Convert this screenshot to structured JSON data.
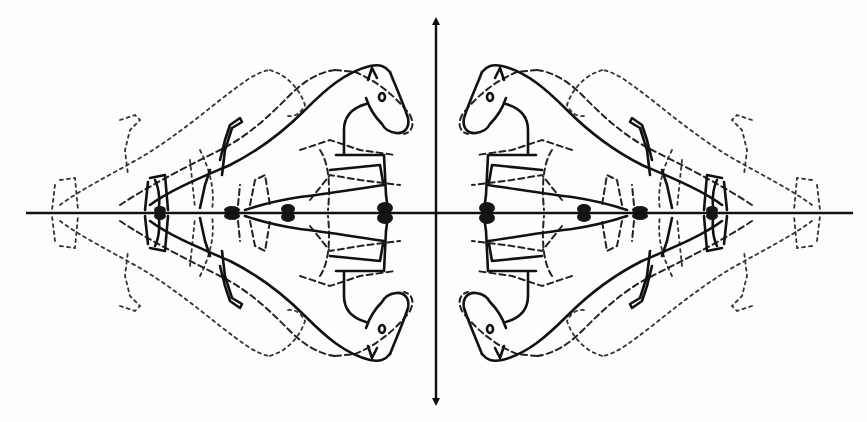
{
  "figure": {
    "colors": {
      "line": "#111111",
      "background": "#fdfdfd"
    },
    "axes": {
      "origin": [
        436,
        213
      ],
      "horizontal": {
        "x_start": 26,
        "x_end": 853,
        "y": 213
      },
      "vertical": {
        "x": 436,
        "y_start": 20,
        "y_end": 403
      }
    },
    "quadrant_copies": [
      "top-left",
      "top-right",
      "bottom-left",
      "bottom-right"
    ],
    "styles": [
      "solid",
      "dashed",
      "dotted"
    ]
  }
}
